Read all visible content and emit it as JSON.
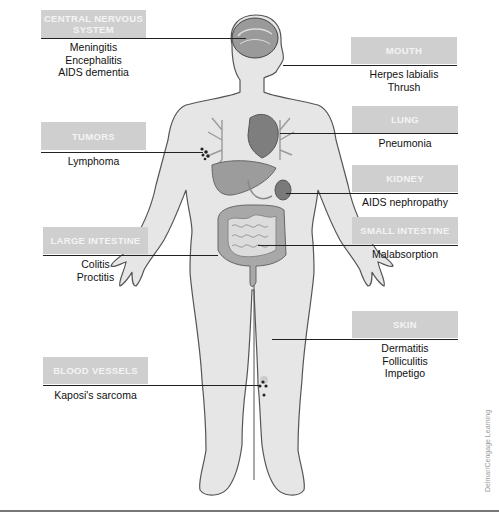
{
  "diagram": {
    "credit": "Delmar/Cengage Learning",
    "colors": {
      "box_fill": "#cfcfcf",
      "box_text": "#f4f4f4",
      "body_fill": "#e6e6e6",
      "body_outline": "#555555",
      "organ_fill": "#8a8a8a",
      "line": "#222222"
    },
    "callouts": [
      {
        "id": "cns",
        "title_line1": "CENTRAL NERVOUS",
        "title_line2": "SYSTEM",
        "conditions": [
          "Meningitis",
          "Encephalitis",
          "AIDS dementia"
        ]
      },
      {
        "id": "mouth",
        "title": "MOUTH",
        "conditions": [
          "Herpes labialis",
          "Thrush"
        ]
      },
      {
        "id": "lung",
        "title": "LUNG",
        "conditions": [
          "Pneumonia"
        ]
      },
      {
        "id": "tumors",
        "title": "TUMORS",
        "conditions": [
          "Lymphoma"
        ]
      },
      {
        "id": "kidney",
        "title": "KIDNEY",
        "conditions": [
          "AIDS nephropathy"
        ]
      },
      {
        "id": "large_intestine",
        "title": "LARGE INTESTINE",
        "conditions": [
          "Colitis",
          "Proctitis"
        ]
      },
      {
        "id": "small_intestine",
        "title": "SMALL INTESTINE",
        "conditions": [
          "Malabsorption"
        ]
      },
      {
        "id": "skin",
        "title": "SKIN",
        "conditions": [
          "Dermatitis",
          "Folliculitis",
          "Impetigo"
        ]
      },
      {
        "id": "blood_vessels",
        "title": "BLOOD VESSELS",
        "conditions": [
          "Kaposi's sarcoma"
        ]
      }
    ]
  }
}
